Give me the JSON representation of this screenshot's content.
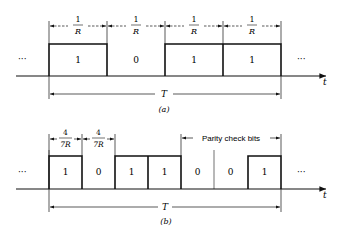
{
  "panel_a": {
    "caption": "(a)",
    "bits": [
      "1",
      "0",
      "1",
      "1"
    ],
    "bit_width_label": {
      "numerator": "1",
      "denominator": "R"
    },
    "period_label": "T",
    "axis_label": "t",
    "ellipsis_left": "···",
    "ellipsis_right": "···"
  },
  "panel_b": {
    "caption": "(b)",
    "bits": [
      "1",
      "0",
      "1",
      "1",
      "0",
      "0",
      "1"
    ],
    "bit_width_label": {
      "numerator": "4",
      "denominator": "7R"
    },
    "parity_label": "Parity check bits",
    "period_label": "T",
    "axis_label": "t",
    "ellipsis_left": "···",
    "ellipsis_right": "···"
  },
  "colors": {
    "ink": "#111111",
    "background": "#ffffff"
  }
}
